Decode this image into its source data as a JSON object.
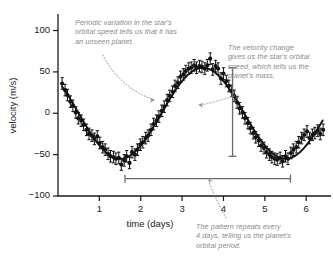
{
  "chart_data": {
    "type": "scatter",
    "title": "",
    "xlabel": "time (days)",
    "ylabel": "velocity (m/s)",
    "xlim": [
      0,
      6.6
    ],
    "ylim": [
      -100,
      120
    ],
    "xticks": [
      1,
      2,
      3,
      4,
      5,
      6
    ],
    "yticks": [
      100,
      50,
      0,
      -50,
      -100
    ],
    "xtick_labels": [
      "1",
      "2",
      "3",
      "4",
      "5",
      "6"
    ],
    "ytick_labels": [
      "100",
      "50",
      "0",
      "-50",
      "-100"
    ],
    "grid": false,
    "legend": "none",
    "series": [
      {
        "name": "fitted sinusoid",
        "style": "line",
        "color": "#111111",
        "model": "v = 55 * sin(2*pi*(t - 2.5)/4.0)",
        "amplitude": 55,
        "period_days": 4.0,
        "phase_min_day": 1.5,
        "phase_max_day": 3.5
      },
      {
        "name": "radial velocity measurements",
        "style": "points-with-errorbars",
        "color": "#111111",
        "errorbar_m_s": 7,
        "x": [
          0.1,
          0.17,
          0.23,
          0.3,
          0.36,
          0.43,
          0.49,
          0.56,
          0.62,
          0.69,
          0.75,
          0.82,
          0.88,
          0.95,
          1.01,
          1.08,
          1.14,
          1.21,
          1.27,
          1.34,
          1.4,
          1.47,
          1.53,
          1.6,
          1.66,
          1.73,
          1.79,
          1.86,
          1.92,
          1.99,
          2.05,
          2.12,
          2.18,
          2.25,
          2.31,
          2.38,
          2.44,
          2.51,
          2.57,
          2.64,
          2.7,
          2.77,
          2.83,
          2.9,
          2.96,
          3.03,
          3.09,
          3.16,
          3.22,
          3.29,
          3.35,
          3.42,
          3.48,
          3.55,
          3.61,
          3.68,
          3.74,
          3.81,
          3.87,
          3.94,
          4.0,
          4.07,
          4.13,
          4.2,
          4.26,
          4.33,
          4.39,
          4.46,
          4.52,
          4.59,
          4.65,
          4.72,
          4.78,
          4.85,
          4.91,
          4.98,
          5.04,
          5.11,
          5.17,
          5.24,
          5.3,
          5.37,
          5.43,
          5.5,
          5.56,
          5.63,
          5.69,
          5.76,
          5.82,
          5.89,
          5.95,
          6.02,
          6.08,
          6.15,
          6.21,
          6.28,
          6.34,
          6.41
        ],
        "y": [
          36,
          28,
          22,
          14,
          9,
          1,
          -6,
          -9,
          -14,
          -20,
          -25,
          -27,
          -31,
          -28,
          -36,
          -41,
          -44,
          -49,
          -52,
          -53,
          -55,
          -54,
          -62,
          -57,
          -52,
          -60,
          -47,
          -50,
          -44,
          -38,
          -35,
          -30,
          -27,
          -20,
          -13,
          -9,
          -4,
          3,
          8,
          16,
          21,
          26,
          33,
          37,
          44,
          47,
          51,
          54,
          55,
          58,
          55,
          57,
          56,
          54,
          58,
          66,
          53,
          57,
          54,
          42,
          48,
          39,
          33,
          27,
          21,
          13,
          6,
          1,
          -6,
          -12,
          -18,
          -24,
          -29,
          -33,
          -39,
          -42,
          -47,
          -50,
          -53,
          -55,
          -56,
          -54,
          -58,
          -52,
          -55,
          -48,
          -44,
          -41,
          -35,
          -30,
          -26,
          -22,
          -30,
          -26,
          -24,
          -21,
          -25,
          -20
        ]
      }
    ],
    "annotations": [
      {
        "name": "periodic-variation",
        "text": "Periodic variation in the star's\norbital speed tells us that it has\nan unseen planet.",
        "leader": "dotted-curve-arrow",
        "points_to": "data curve near day 2.5"
      },
      {
        "name": "velocity-change",
        "text": "The velocity change\ngives us the star's orbital\nspeed, which tells us the\nplanet's mass.",
        "leader": "dotted-curve-arrow",
        "points_to": "vertical amplitude bar"
      },
      {
        "name": "orbital-period",
        "text": "The pattern repeats every\n4 days, telling us the planet's\norbital period.",
        "leader": "dotted-curve-arrow",
        "points_to": "horizontal period bar"
      }
    ],
    "measure_markers": [
      {
        "name": "velocity-amplitude-bar",
        "orientation": "vertical",
        "x_day": 4.22,
        "y_from": 55,
        "y_to": -52,
        "description": "double-ended bar spanning full velocity swing"
      },
      {
        "name": "orbital-period-bar",
        "orientation": "horizontal",
        "y_value": -79,
        "x_from": 1.62,
        "x_to": 5.62,
        "span_days": 4,
        "description": "double-ended bar spanning one full period"
      }
    ],
    "colors": {
      "axis": "#1a1a1a",
      "data": "#111111",
      "annotation_text": "#8a8a8a",
      "leader": "#8a8a8a",
      "marker": "#555555",
      "background": "#ffffff"
    }
  }
}
